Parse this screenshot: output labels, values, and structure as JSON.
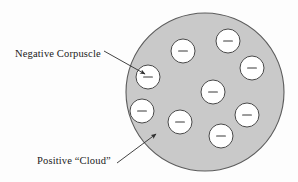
{
  "figure": {
    "background_color": "#fdfdfd"
  },
  "cloud": {
    "label": "Positive “Cloud”",
    "fill_color": "#c9c9c9",
    "stroke_color": "#5c5c5c",
    "center_x": 205,
    "center_y": 92,
    "radius": 79
  },
  "corpuscle": {
    "label": "Negative Corpuscle",
    "fill_color": "#ffffff",
    "stroke_color": "#4a4a4a",
    "sign": "−",
    "radius": 12,
    "count": 9,
    "positions": [
      {
        "cx": 148,
        "cy": 77
      },
      {
        "cx": 183,
        "cy": 51
      },
      {
        "cx": 228,
        "cy": 41
      },
      {
        "cx": 252,
        "cy": 68
      },
      {
        "cx": 213,
        "cy": 92
      },
      {
        "cx": 142,
        "cy": 111
      },
      {
        "cx": 180,
        "cy": 122
      },
      {
        "cx": 247,
        "cy": 115
      },
      {
        "cx": 221,
        "cy": 136
      }
    ]
  },
  "leaders": {
    "corpuscle_arrow": {
      "x1": 104,
      "y1": 51,
      "x2": 145,
      "y2": 74,
      "text_x": 15,
      "text_y": 57
    },
    "cloud_arrow": {
      "x1": 117,
      "y1": 163,
      "x2": 156,
      "y2": 134,
      "text_x": 37,
      "text_y": 164
    }
  }
}
